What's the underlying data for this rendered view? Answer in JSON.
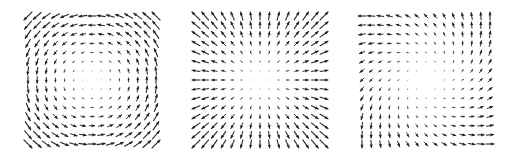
{
  "chart_data": [
    {
      "type": "quiver",
      "title": "",
      "field": "rotation",
      "formula": "F(x,y) = (-y, x)",
      "description": "Counterclockwise rotational vector field; arrow length grows with distance from origin",
      "grid": {
        "nx": 15,
        "ny": 15,
        "xlim": [
          -1,
          1
        ],
        "ylim": [
          -1,
          1
        ]
      },
      "axes_visible": false,
      "arrow_color": "#222222"
    },
    {
      "type": "quiver",
      "title": "",
      "field": "radial-source",
      "formula": "F(x,y) = (x, y)",
      "description": "Radially outward vector field; arrow length grows with distance from origin",
      "grid": {
        "nx": 15,
        "ny": 15,
        "xlim": [
          -1,
          1
        ],
        "ylim": [
          -1,
          1
        ]
      },
      "axes_visible": false,
      "arrow_color": "#222222"
    },
    {
      "type": "quiver",
      "title": "",
      "field": "shear-rotation",
      "formula": "F(x,y) = (-y, x) + saddle-like component (top-left points left, top-right points up, bottom-right points right, bottom-left points down)",
      "description": "Combined field: vectors on top row point left, right column up, bottom row right, left column down",
      "grid": {
        "nx": 15,
        "ny": 15,
        "xlim": [
          -1,
          1
        ],
        "ylim": [
          -1,
          1
        ]
      },
      "axes_visible": false,
      "arrow_color": "#222222"
    }
  ],
  "captions": [
    "",
    "",
    ""
  ]
}
